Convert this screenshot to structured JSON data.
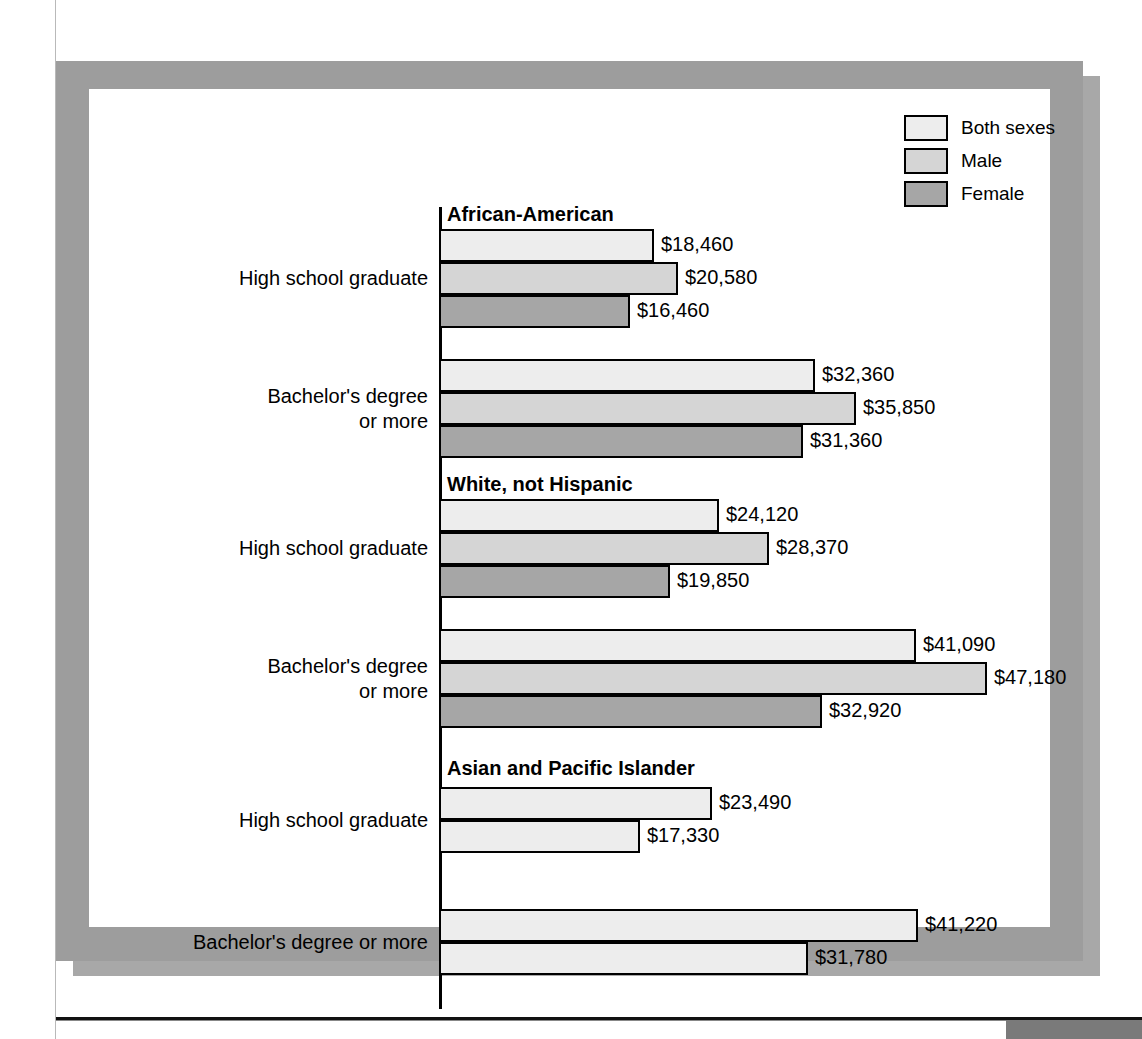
{
  "chart_data": {
    "type": "bar",
    "orientation": "horizontal",
    "title": "",
    "xlabel": "",
    "ylabel": "",
    "grid": false,
    "legend_position": "top-right",
    "value_prefix": "$",
    "axis_max": 50000,
    "legend": [
      {
        "name": "Both sexes",
        "color": "#ededed"
      },
      {
        "name": "Male",
        "color": "#d5d5d5"
      },
      {
        "name": "Female",
        "color": "#a6a6a6"
      }
    ],
    "series": [
      {
        "name": "Both sexes",
        "values": [
          18460,
          32360,
          24120,
          41090,
          23490,
          41220
        ]
      },
      {
        "name": "Male",
        "values": [
          20580,
          35850,
          28370,
          47180,
          17330,
          31780
        ]
      },
      {
        "name": "Female",
        "values": [
          16460,
          31360,
          19850,
          32920,
          null,
          null
        ]
      }
    ],
    "panels": [
      {
        "title": "African-American",
        "groups": [
          {
            "label": "High school graduate",
            "label_lines": [
              "High school graduate"
            ],
            "bars": [
              {
                "series": "Both sexes",
                "value": 18460,
                "label": "$18,460",
                "color": "#ededed"
              },
              {
                "series": "Male",
                "value": 20580,
                "label": "$20,580",
                "color": "#d5d5d5"
              },
              {
                "series": "Female",
                "value": 16460,
                "label": "$16,460",
                "color": "#a6a6a6"
              }
            ]
          },
          {
            "label": "Bachelor's degree or more",
            "label_lines": [
              "Bachelor's degree",
              "or more"
            ],
            "bars": [
              {
                "series": "Both sexes",
                "value": 32360,
                "label": "$32,360",
                "color": "#ededed"
              },
              {
                "series": "Male",
                "value": 35850,
                "label": "$35,850",
                "color": "#d5d5d5"
              },
              {
                "series": "Female",
                "value": 31360,
                "label": "$31,360",
                "color": "#a6a6a6"
              }
            ]
          }
        ]
      },
      {
        "title": "White, not Hispanic",
        "groups": [
          {
            "label": "High school graduate",
            "label_lines": [
              "High school graduate"
            ],
            "bars": [
              {
                "series": "Both sexes",
                "value": 24120,
                "label": "$24,120",
                "color": "#ededed"
              },
              {
                "series": "Male",
                "value": 28370,
                "label": "$28,370",
                "color": "#d5d5d5"
              },
              {
                "series": "Female",
                "value": 19850,
                "label": "$19,850",
                "color": "#a6a6a6"
              }
            ]
          },
          {
            "label": "Bachelor's degree or more",
            "label_lines": [
              "Bachelor's degree",
              "or more"
            ],
            "bars": [
              {
                "series": "Both sexes",
                "value": 41090,
                "label": "$41,090",
                "color": "#ededed"
              },
              {
                "series": "Male",
                "value": 47180,
                "label": "$47,180",
                "color": "#d5d5d5"
              },
              {
                "series": "Female",
                "value": 32920,
                "label": "$32,920",
                "color": "#a6a6a6"
              }
            ]
          }
        ]
      },
      {
        "title": "Asian and Pacific Islander",
        "groups": [
          {
            "label": "High school graduate",
            "label_lines": [
              "High school graduate"
            ],
            "bars": [
              {
                "series": "Both sexes",
                "value": 23490,
                "label": "$23,490",
                "color": "#ededed"
              },
              {
                "series": "Male",
                "value": 17330,
                "label": "$17,330",
                "color": "#ededed"
              }
            ]
          },
          {
            "label": "Bachelor's degree or more",
            "label_lines": [
              "Bachelor's degree or more"
            ],
            "bars": [
              {
                "series": "Both sexes",
                "value": 41220,
                "label": "$41,220",
                "color": "#ededed"
              },
              {
                "series": "Male",
                "value": 31780,
                "label": "$31,780",
                "color": "#ededed"
              }
            ]
          }
        ]
      }
    ]
  }
}
